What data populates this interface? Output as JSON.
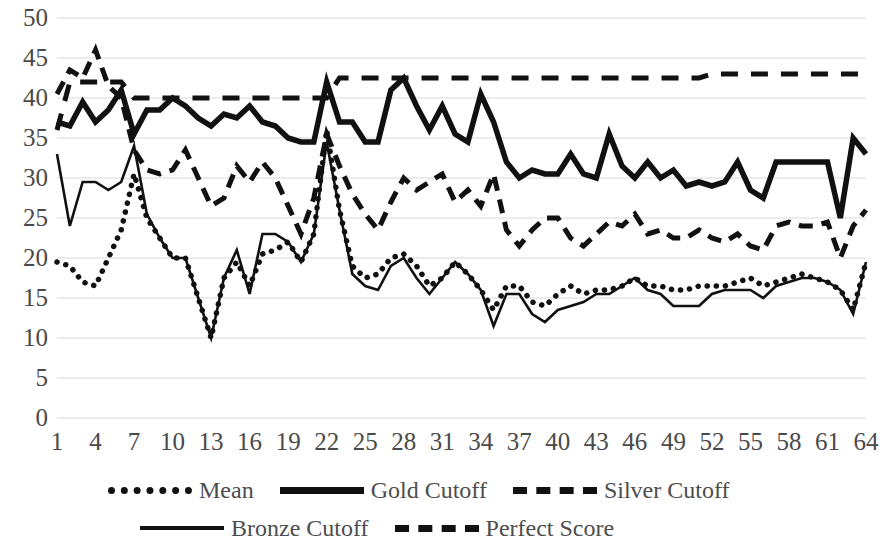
{
  "chart_data": {
    "type": "line",
    "title": "",
    "xlabel": "",
    "ylabel": "",
    "ylim": [
      0,
      50
    ],
    "xlim": [
      1,
      64
    ],
    "ytick_labels": [
      "50",
      "45",
      "40",
      "35",
      "30",
      "25",
      "20",
      "15",
      "10",
      "5",
      "0"
    ],
    "ytick_values": [
      50,
      45,
      40,
      35,
      30,
      25,
      20,
      15,
      10,
      5,
      0
    ],
    "xtick_labels": [
      "1",
      "4",
      "7",
      "10",
      "13",
      "16",
      "19",
      "22",
      "25",
      "28",
      "31",
      "34",
      "37",
      "40",
      "43",
      "46",
      "49",
      "52",
      "55",
      "58",
      "61",
      "64"
    ],
    "xtick_values": [
      1,
      4,
      7,
      10,
      13,
      16,
      19,
      22,
      25,
      28,
      31,
      34,
      37,
      40,
      43,
      46,
      49,
      52,
      55,
      58,
      61,
      64
    ],
    "x": [
      1,
      2,
      3,
      4,
      5,
      6,
      7,
      8,
      9,
      10,
      11,
      12,
      13,
      14,
      15,
      16,
      17,
      18,
      19,
      20,
      21,
      22,
      23,
      24,
      25,
      26,
      27,
      28,
      29,
      30,
      31,
      32,
      33,
      34,
      35,
      36,
      37,
      38,
      39,
      40,
      41,
      42,
      43,
      44,
      45,
      46,
      47,
      48,
      49,
      50,
      51,
      52,
      53,
      54,
      55,
      56,
      57,
      58,
      59,
      60,
      61,
      62,
      63,
      64
    ],
    "grid": true,
    "grid_color": "#d9d9d9",
    "legend_position": "bottom",
    "line_color": "#111111",
    "series": [
      {
        "name": "Mean",
        "style": "dotted",
        "values": [
          19.5,
          19.0,
          17.0,
          16.5,
          20.0,
          23.5,
          30.5,
          25.0,
          22.5,
          20.0,
          20.0,
          15.0,
          10.0,
          17.5,
          19.5,
          16.5,
          20.5,
          21.0,
          22.0,
          19.5,
          23.0,
          36.0,
          26.0,
          19.0,
          17.5,
          18.0,
          20.0,
          20.5,
          19.0,
          16.5,
          17.5,
          19.5,
          18.0,
          16.0,
          13.5,
          16.5,
          16.5,
          14.5,
          14.0,
          15.5,
          16.5,
          15.5,
          16.0,
          16.0,
          16.5,
          17.5,
          16.5,
          16.5,
          16.0,
          16.0,
          16.5,
          16.5,
          16.5,
          17.0,
          17.5,
          16.5,
          17.0,
          17.5,
          18.0,
          17.5,
          17.0,
          16.0,
          13.5,
          19.5
        ]
      },
      {
        "name": "Gold Cutoff",
        "style": "solid-thick",
        "values": [
          37.0,
          36.5,
          39.5,
          37.0,
          38.5,
          41.0,
          35.5,
          38.5,
          38.5,
          40.0,
          39.0,
          37.5,
          36.5,
          38.0,
          37.5,
          39.0,
          37.0,
          36.5,
          35.0,
          34.5,
          34.5,
          42.0,
          37.0,
          37.0,
          34.5,
          34.5,
          41.0,
          42.5,
          39.0,
          36.0,
          39.0,
          35.5,
          34.5,
          40.5,
          37.0,
          32.0,
          30.0,
          31.0,
          30.5,
          30.5,
          33.0,
          30.5,
          30.0,
          35.5,
          31.5,
          30.0,
          32.0,
          30.0,
          31.0,
          29.0,
          29.5,
          29.0,
          29.5,
          32.0,
          28.5,
          27.5,
          32.0,
          32.0,
          32.0,
          32.0,
          32.0,
          25.0,
          35.0,
          33.0
        ]
      },
      {
        "name": "Silver Cutoff",
        "style": "dashed",
        "values": [
          40.5,
          43.5,
          42.5,
          46.0,
          41.5,
          40.0,
          33.5,
          31.0,
          30.5,
          31.0,
          33.5,
          30.0,
          26.5,
          27.5,
          31.5,
          29.5,
          32.0,
          30.0,
          26.5,
          23.0,
          27.5,
          35.5,
          31.5,
          28.0,
          25.5,
          23.5,
          27.0,
          30.0,
          28.5,
          29.5,
          30.5,
          27.0,
          28.5,
          26.5,
          30.5,
          23.5,
          21.5,
          23.5,
          25.0,
          25.0,
          22.5,
          21.5,
          23.0,
          24.5,
          24.0,
          25.5,
          23.0,
          23.5,
          22.5,
          22.5,
          23.5,
          22.5,
          22.0,
          23.0,
          21.5,
          21.0,
          24.0,
          24.5,
          24.0,
          24.0,
          24.5,
          20.0,
          24.0,
          26.0
        ]
      },
      {
        "name": "Bronze Cutoff",
        "style": "solid-thin",
        "values": [
          33.0,
          24.0,
          29.5,
          29.5,
          28.5,
          29.5,
          34.0,
          25.5,
          22.5,
          20.0,
          20.0,
          15.0,
          10.0,
          17.5,
          21.0,
          15.5,
          23.0,
          23.0,
          22.0,
          19.5,
          23.0,
          34.5,
          26.0,
          18.0,
          16.5,
          16.0,
          19.0,
          20.0,
          17.5,
          15.5,
          17.5,
          19.5,
          18.0,
          16.0,
          11.5,
          15.5,
          15.5,
          13.0,
          12.0,
          13.5,
          14.0,
          14.5,
          15.5,
          15.5,
          16.5,
          17.5,
          16.0,
          15.5,
          14.0,
          14.0,
          14.0,
          15.5,
          16.0,
          16.0,
          16.0,
          15.0,
          16.5,
          17.0,
          17.5,
          17.5,
          17.0,
          16.0,
          13.0,
          19.5
        ]
      },
      {
        "name": "Perfect Score",
        "style": "dashed-wide",
        "values": [
          36.0,
          42.0,
          42.0,
          42.0,
          42.0,
          42.0,
          40.0,
          40.0,
          40.0,
          40.0,
          40.0,
          40.0,
          40.0,
          40.0,
          40.0,
          40.0,
          40.0,
          40.0,
          40.0,
          40.0,
          40.0,
          40.0,
          42.5,
          42.5,
          42.5,
          42.5,
          42.5,
          42.5,
          42.5,
          42.5,
          42.5,
          42.5,
          42.5,
          42.5,
          42.5,
          42.5,
          42.5,
          42.5,
          42.5,
          42.5,
          42.5,
          42.5,
          42.5,
          42.5,
          42.5,
          42.5,
          42.5,
          42.5,
          42.5,
          42.5,
          42.5,
          43.0,
          43.0,
          43.0,
          43.0,
          43.0,
          43.0,
          43.0,
          43.0,
          43.0,
          43.0,
          43.0,
          43.0,
          43.0
        ]
      }
    ]
  },
  "legend": {
    "rows": [
      [
        {
          "label": "Mean",
          "style": "dotted"
        },
        {
          "label": "Gold Cutoff",
          "style": "solid-thick"
        },
        {
          "label": "Silver Cutoff",
          "style": "dashed"
        }
      ],
      [
        {
          "label": "Bronze Cutoff",
          "style": "solid-thin"
        },
        {
          "label": "Perfect Score",
          "style": "dashed-wide"
        }
      ]
    ]
  }
}
